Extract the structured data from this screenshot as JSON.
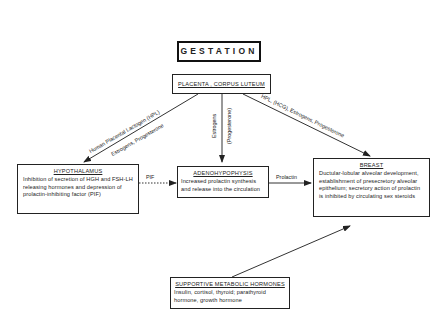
{
  "title": "GESTATION",
  "source": {
    "label": "PLACENTA , CORPUS LUTEUM"
  },
  "nodes": {
    "hypothalamus": {
      "heading": "HYPOTHALAMUS",
      "text": "Inhibition of secretion of HGH and FSH-LH releasing hormones and depression of prolactin-inhibiting factor (PIF)"
    },
    "adenohypophysis": {
      "heading": "ADENOHYPOPHYSIS",
      "text": "Increased prolactin synthesis and release into the circulation"
    },
    "breast": {
      "heading": "BREAST",
      "text": "Ductular-lobular alveolar development, establishment of presecretory alveolar epithelium; secretory action of prolactin is inhibited by circulating sex steroids"
    },
    "supportive": {
      "heading": "SUPPORTIVE METABOLIC HORMONES",
      "text": "Insulin, cortisol, thyroid; parathyroid hormone, growth hormone"
    }
  },
  "edges": {
    "to_hypothalamus_line1": "Human Placental Lactogen (HPL)",
    "to_hypothalamus_line2": "Estrogens, Progesterone",
    "to_adeno_line1": "Estrogens",
    "to_adeno_line2": "(Progesterone)",
    "to_breast": "HPL, (HCG), Estrogens, Progesterone",
    "pif": "PIF",
    "prolactin": "Prolactin"
  }
}
